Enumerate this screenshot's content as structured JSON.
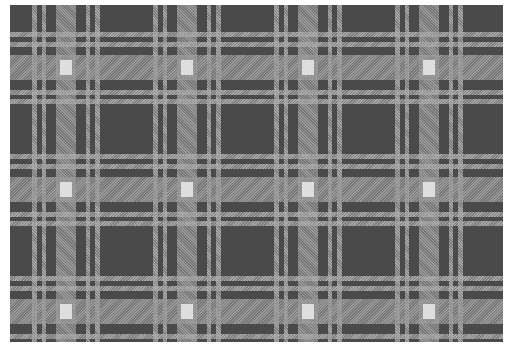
{
  "image": {
    "subject": "Grayscale tartan plaid fabric swatch",
    "colors": {
      "dark_ground": "#4a4a4a",
      "pin_stripe": "#a8a8a8",
      "twill_band": "#9a9a9a",
      "light_intersection": "#e0e0e0",
      "background": "#ffffff"
    },
    "sett": {
      "horizontal_repeat_px": 121,
      "vertical_repeat_px": 122
    }
  }
}
